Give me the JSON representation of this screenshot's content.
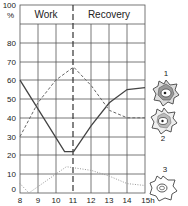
{
  "chart_data": {
    "type": "line",
    "title": "",
    "xlabel": "h",
    "ylabel": "%",
    "xlim": [
      8,
      15
    ],
    "ylim": [
      0,
      100
    ],
    "x_ticks": [
      "8",
      "9",
      "10",
      "11",
      "12",
      "13",
      "14",
      "15h"
    ],
    "y_ticks": [
      "0",
      "10",
      "20",
      "30",
      "40",
      "50",
      "60",
      "70",
      "80",
      "100"
    ],
    "grid": true,
    "phases": [
      {
        "label": "Work",
        "from": 8,
        "to": 11
      },
      {
        "label": "Recovery",
        "from": 11,
        "to": 15
      }
    ],
    "series": [
      {
        "name": "1",
        "style": "solid",
        "x": [
          8,
          10.5,
          11,
          12,
          13,
          14,
          15
        ],
        "y": [
          60,
          22,
          22,
          36,
          48,
          55,
          56
        ]
      },
      {
        "name": "2",
        "style": "dashed",
        "x": [
          8,
          9,
          10,
          11,
          12,
          13,
          14,
          15
        ],
        "y": [
          30,
          48,
          60,
          67,
          57,
          44,
          40,
          40
        ]
      },
      {
        "name": "3",
        "style": "dotted",
        "x": [
          8,
          8.5,
          10.6,
          12,
          13,
          14,
          15
        ],
        "y": [
          5,
          0,
          14,
          12,
          9,
          5,
          4
        ]
      }
    ],
    "legend": [
      {
        "label": "1",
        "icon": "cell-dense-icon"
      },
      {
        "label": "2",
        "icon": "cell-medium-icon"
      },
      {
        "label": "3",
        "icon": "cell-empty-icon"
      }
    ]
  },
  "labels": {
    "y100": "100",
    "ypct": "%",
    "y80": "80",
    "y70": "70",
    "y60": "60",
    "y50": "50",
    "y40": "40",
    "y30": "30",
    "y20": "20",
    "y10": "10",
    "y0": "0",
    "x8": "8",
    "x9": "9",
    "x10": "10",
    "x11": "11",
    "x12": "12",
    "x13": "13",
    "x14": "14",
    "x15": "15h",
    "work": "Work",
    "recovery": "Recovery",
    "legend1": "1",
    "legend2": "2",
    "legend3": "3"
  }
}
